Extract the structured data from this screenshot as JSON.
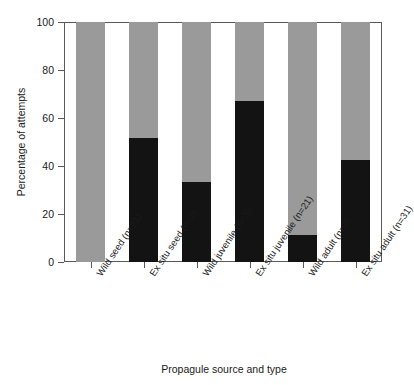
{
  "chart_data": {
    "type": "bar",
    "title": "",
    "subtitle": "",
    "xlabel": "Propagule source and type",
    "ylabel": "Percentage of attempts",
    "ylim": [
      0,
      100
    ],
    "yticks": [
      0,
      20,
      40,
      60,
      80,
      100
    ],
    "ytick_labels": [
      "0",
      "20",
      "40",
      "60",
      "80",
      "100"
    ],
    "grid": false,
    "legend": "none",
    "stacked": true,
    "stack_total": 100,
    "categories": [
      "Wild seed (n=21)",
      "Ex situ seed (n=2)",
      "Wild juvenile (n=3)",
      "Ex situ juvenile (n=21)",
      "Wild adult (n=9)",
      "Ex situ adult (n=31)"
    ],
    "series": [
      {
        "name": "lower-black-segment",
        "color": "#131313",
        "values": [
          0,
          51.7,
          33.3,
          67.1,
          11.3,
          42.5
        ]
      },
      {
        "name": "upper-grey-segment",
        "color": "#9a9a9a",
        "values": [
          100,
          48.3,
          66.7,
          32.9,
          88.7,
          57.5
        ]
      }
    ]
  },
  "colors": {
    "black_segment": "#131313",
    "grey_segment": "#9a9a9a",
    "axis": "#5a5a5a",
    "text": "#1a1a1a",
    "background": "#ffffff"
  }
}
